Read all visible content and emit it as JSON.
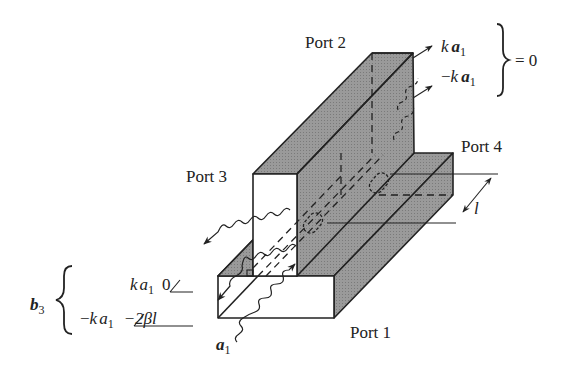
{
  "diagram": {
    "type": "waveguide-directional-coupler",
    "ports": [
      {
        "id": "port1",
        "label": "Port 1"
      },
      {
        "id": "port2",
        "label": "Port 2"
      },
      {
        "id": "port3",
        "label": "Port 3"
      },
      {
        "id": "port4",
        "label": "Port 4"
      }
    ],
    "port2_outputs": {
      "upper": {
        "coef": "k",
        "var": "a",
        "sub": "1"
      },
      "lower": {
        "sign": "−",
        "coef": "k",
        "var": "a",
        "sub": "1"
      },
      "equals": "= 0"
    },
    "b3": {
      "var": "b",
      "sub": "3",
      "upper": {
        "coef": "k",
        "var": "a",
        "sub": "1",
        "angle": "0"
      },
      "lower": {
        "sign": "−",
        "coef": "k",
        "var": "a",
        "sub": "1",
        "angle": "−2βl"
      }
    },
    "input": {
      "var": "a",
      "sub": "1"
    },
    "spacing": {
      "label": "l"
    },
    "colors": {
      "shaded_face": "#8f8f8f",
      "line": "#222222",
      "background": "#ffffff"
    }
  }
}
